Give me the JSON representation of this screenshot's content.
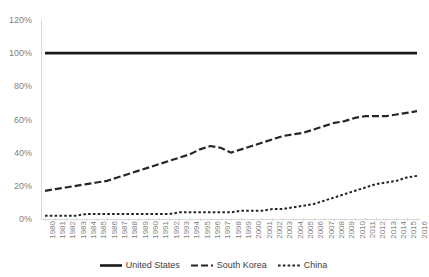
{
  "chart_data": {
    "type": "line",
    "title": "",
    "xlabel": "",
    "ylabel": "",
    "ylim": [
      0,
      120
    ],
    "ytick_labels": [
      "120%",
      "100%",
      "80%",
      "60%",
      "40%",
      "20%",
      "0%"
    ],
    "ytick_values": [
      120,
      100,
      80,
      60,
      40,
      20,
      0
    ],
    "grid": false,
    "legend_position": "bottom",
    "x": [
      1980,
      1981,
      1982,
      1983,
      1984,
      1985,
      1986,
      1987,
      1988,
      1989,
      1990,
      1991,
      1992,
      1993,
      1994,
      1995,
      1996,
      1997,
      1998,
      1999,
      2000,
      2001,
      2002,
      2003,
      2004,
      2005,
      2006,
      2007,
      2008,
      2009,
      2010,
      2011,
      2012,
      2013,
      2014,
      2015,
      2016
    ],
    "xtick_labels": [
      "1980",
      "1981",
      "1982",
      "1983",
      "1984",
      "1985",
      "1986",
      "1987",
      "1988",
      "1989",
      "1990",
      "1991",
      "1992",
      "1993",
      "1994",
      "1995",
      "1996",
      "1997",
      "1998",
      "1999",
      "2000",
      "2001",
      "2002",
      "2003",
      "2004",
      "2005",
      "2006",
      "2007",
      "2008",
      "2009",
      "2010",
      "2011",
      "2012",
      "2013",
      "2014",
      "2015",
      "2016"
    ],
    "series": [
      {
        "name": "United States",
        "style": "solid",
        "color": "#1a1a1a",
        "values": [
          100,
          100,
          100,
          100,
          100,
          100,
          100,
          100,
          100,
          100,
          100,
          100,
          100,
          100,
          100,
          100,
          100,
          100,
          100,
          100,
          100,
          100,
          100,
          100,
          100,
          100,
          100,
          100,
          100,
          100,
          100,
          100,
          100,
          100,
          100,
          100,
          100
        ]
      },
      {
        "name": "South Korea",
        "style": "dash-dot",
        "color": "#262626",
        "values": [
          17,
          18,
          19,
          20,
          21,
          22,
          23,
          25,
          27,
          29,
          31,
          33,
          35,
          37,
          39,
          42,
          44,
          43,
          40,
          42,
          44,
          46,
          48,
          50,
          51,
          52,
          54,
          56,
          58,
          59,
          61,
          62,
          62,
          62,
          63,
          64,
          65
        ]
      },
      {
        "name": "China",
        "style": "dotted",
        "color": "#262626",
        "values": [
          2,
          2,
          2,
          2,
          3,
          3,
          3,
          3,
          3,
          3,
          3,
          3,
          3,
          4,
          4,
          4,
          4,
          4,
          4,
          5,
          5,
          5,
          6,
          6,
          7,
          8,
          9,
          11,
          13,
          15,
          17,
          19,
          21,
          22,
          23,
          25,
          26
        ]
      }
    ]
  },
  "legend": {
    "items": [
      {
        "label": "United States"
      },
      {
        "label": "South Korea"
      },
      {
        "label": "China"
      }
    ]
  }
}
